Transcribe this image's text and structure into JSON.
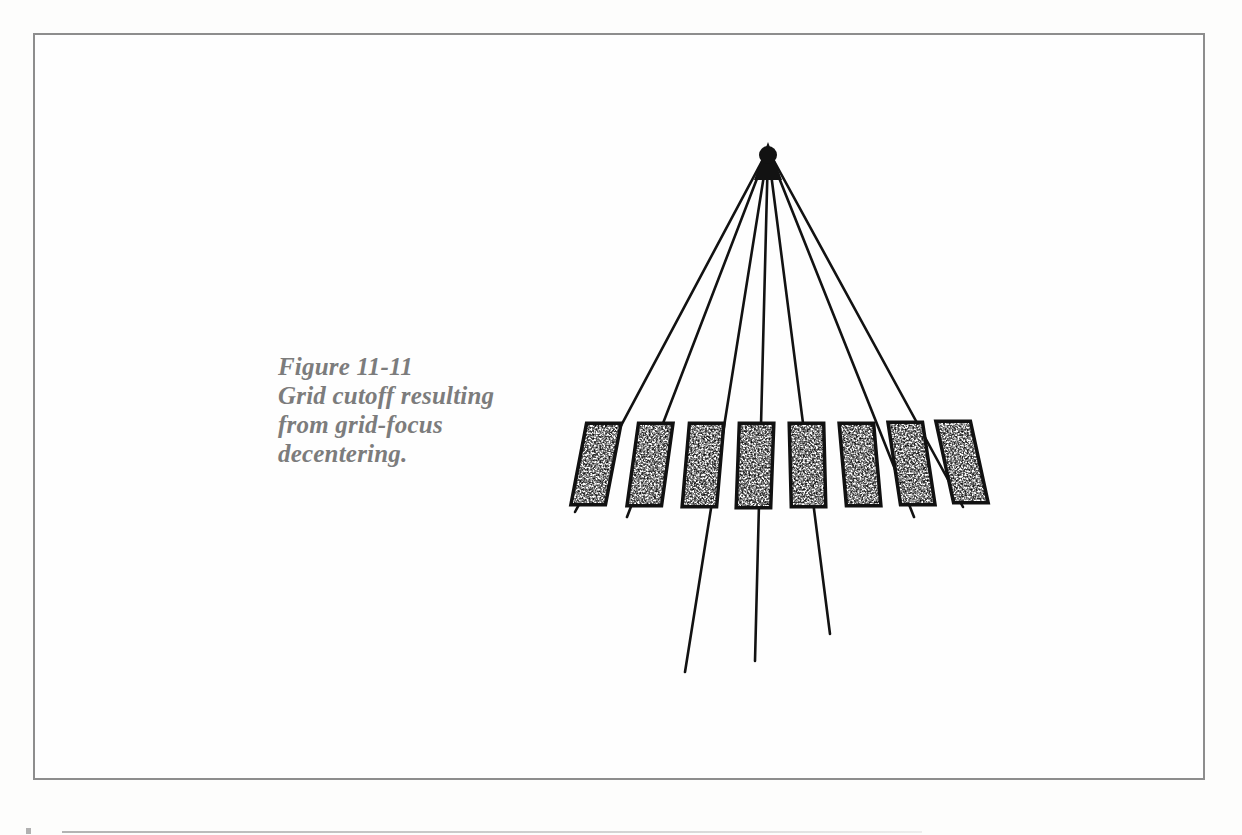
{
  "page": {
    "width": 1242,
    "height": 835,
    "background_color": "#fdfdfc",
    "kind": "book-figure-scan"
  },
  "frame": {
    "name": "figure-border",
    "x": 33,
    "y": 33,
    "width": 1172,
    "height": 747,
    "stroke_color": "#8d8d8d",
    "stroke_width": 2,
    "fill_color": "#fefefe"
  },
  "caption": {
    "label": "Figure 11-11",
    "line1": "Figure 11-11",
    "line2": "Grid cutoff resulting",
    "line3": "from grid-focus",
    "line4": "decentering.",
    "full_text": "Figure 11-11 Grid cutoff resulting from grid-focus decentering.",
    "color": "#7c7c7c",
    "font_size_px": 25,
    "style": "bold-italic-serif",
    "x": 278,
    "y": 352
  },
  "diagram": {
    "ink_color": "#121212",
    "focus": {
      "name": "focal-point",
      "x": 768,
      "y": 148,
      "label": "x-ray focal spot (apex)"
    },
    "rays": [
      {
        "id": "ray-1",
        "x1": 768,
        "y1": 148,
        "x2": 575,
        "y2": 510,
        "extends_below_grid": false
      },
      {
        "id": "ray-2",
        "x1": 768,
        "y1": 148,
        "x2": 626,
        "y2": 515,
        "extends_below_grid": false
      },
      {
        "id": "ray-3",
        "x1": 768,
        "y1": 148,
        "x2": 685,
        "y2": 672,
        "extends_below_grid": true
      },
      {
        "id": "ray-4",
        "x1": 768,
        "y1": 148,
        "x2": 755,
        "y2": 661,
        "extends_below_grid": true
      },
      {
        "id": "ray-5",
        "x1": 768,
        "y1": 148,
        "x2": 830,
        "y2": 634,
        "extends_below_grid": true
      },
      {
        "id": "ray-6",
        "x1": 768,
        "y1": 148,
        "x2": 913,
        "y2": 515,
        "extends_below_grid": false
      },
      {
        "id": "ray-7",
        "x1": 768,
        "y1": 148,
        "x2": 962,
        "y2": 505,
        "extends_below_grid": false
      }
    ],
    "ray_stroke_width": 2.6,
    "grid": {
      "name": "antiscatter-grid",
      "strip_count": 8,
      "strip_top_y": 425,
      "strip_bottom_y": 503,
      "strip_outline_width": 4,
      "strip_fill": "stipple",
      "strips": [
        {
          "id": "grid-strip-1",
          "top_left_x": 588,
          "bottom_left_x": 573,
          "width": 26,
          "tilt": "right-leaning"
        },
        {
          "id": "grid-strip-2",
          "top_left_x": 639,
          "bottom_left_x": 628,
          "width": 26,
          "tilt": "right-leaning"
        },
        {
          "id": "grid-strip-3",
          "top_left_x": 690,
          "bottom_left_x": 683,
          "width": 26,
          "tilt": "right-leaning"
        },
        {
          "id": "grid-strip-4",
          "top_left_x": 740,
          "bottom_left_x": 737,
          "width": 26,
          "tilt": "right-leaning"
        },
        {
          "id": "grid-strip-5",
          "top_left_x": 790,
          "bottom_left_x": 792,
          "width": 26,
          "tilt": "left-leaning"
        },
        {
          "id": "grid-strip-6",
          "top_left_x": 840,
          "bottom_left_x": 847,
          "width": 26,
          "tilt": "left-leaning"
        },
        {
          "id": "grid-strip-7",
          "top_left_x": 889,
          "bottom_left_x": 901,
          "width": 26,
          "tilt": "left-leaning"
        },
        {
          "id": "grid-strip-8",
          "top_left_x": 937,
          "bottom_left_x": 955,
          "width": 26,
          "tilt": "left-leaning"
        }
      ]
    }
  },
  "bottom_marks": {
    "rule_label": "page-edge-rule",
    "rule_x": 62,
    "rule_y": 831,
    "rule_width": 860,
    "tick_label": "page-edge-tick"
  }
}
